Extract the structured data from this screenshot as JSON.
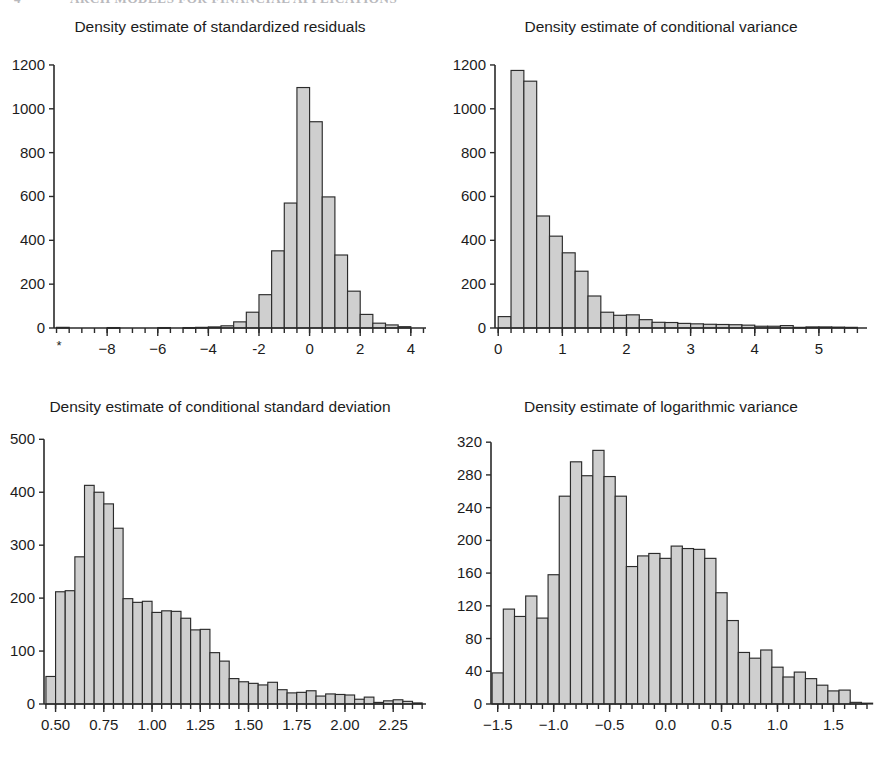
{
  "page": {
    "running_header": {
      "folio": "4",
      "title": "ARCH MODELS FOR FINANCIAL APPLICATIONS"
    },
    "background_color": "#ffffff",
    "bar_fill_color": "#cfcfcf",
    "bar_stroke_color": "#2b2b2b",
    "text_color": "#1c1c1c"
  },
  "chart_data": [
    {
      "id": "standardized-residuals",
      "type": "bar",
      "title": "Density estimate of standardized residuals",
      "xlabel": "",
      "ylabel": "",
      "grid": false,
      "legend": null,
      "xlim": [
        -10.1,
        4.6
      ],
      "ylim": [
        0,
        1250
      ],
      "xticks": [
        -8,
        -6,
        -4,
        -2,
        0,
        2,
        4
      ],
      "xtick_labels": [
        "−8",
        "−6",
        "−4",
        "-2",
        "0",
        "2",
        "4"
      ],
      "yticks": [
        0,
        200,
        400,
        600,
        800,
        1000,
        1200
      ],
      "ytick_labels": [
        "0",
        "200",
        "400",
        "600",
        "800",
        "1000",
        "1200"
      ],
      "minor_tick_step": 0.5,
      "extra_marks": [
        {
          "glyph": "*",
          "x": -9.9,
          "note": "outlier marker at left edge of axis"
        }
      ],
      "bin_width": 0.5,
      "bin_starts": [
        -10.0,
        -9.5,
        -9.0,
        -8.5,
        -8.0,
        -7.5,
        -7.0,
        -6.5,
        -6.0,
        -5.5,
        -5.0,
        -4.5,
        -4.0,
        -3.5,
        -3.0,
        -2.5,
        -2.0,
        -1.5,
        -1.0,
        -0.5,
        0.0,
        0.5,
        1.0,
        1.5,
        2.0,
        2.5,
        3.0,
        3.5
      ],
      "values": [
        3,
        0,
        0,
        0,
        2,
        0,
        0,
        0,
        2,
        0,
        2,
        3,
        5,
        10,
        28,
        72,
        152,
        352,
        570,
        1097,
        941,
        598,
        333,
        168,
        62,
        22,
        14,
        6
      ]
    },
    {
      "id": "conditional-variance",
      "type": "bar",
      "title": "Density estimate of conditional variance",
      "xlabel": "",
      "ylabel": "",
      "grid": false,
      "legend": null,
      "xlim": [
        -0.05,
        5.75
      ],
      "ylim": [
        0,
        1250
      ],
      "xticks": [
        0,
        1,
        2,
        3,
        4,
        5
      ],
      "xtick_labels": [
        "0",
        "1",
        "2",
        "3",
        "4",
        "5"
      ],
      "yticks": [
        0,
        200,
        400,
        600,
        800,
        1000,
        1200
      ],
      "ytick_labels": [
        "0",
        "200",
        "400",
        "600",
        "800",
        "1000",
        "1200"
      ],
      "minor_tick_step": 0.2,
      "extra_marks": [],
      "bin_width": 0.2,
      "bin_starts": [
        0.0,
        0.2,
        0.4,
        0.6,
        0.8,
        1.0,
        1.2,
        1.4,
        1.6,
        1.8,
        2.0,
        2.2,
        2.4,
        2.6,
        2.8,
        3.0,
        3.2,
        3.4,
        3.6,
        3.8,
        4.0,
        4.2,
        4.4,
        4.6,
        4.8,
        5.0,
        5.2,
        5.4
      ],
      "values": [
        52,
        1175,
        1126,
        511,
        419,
        343,
        259,
        146,
        72,
        58,
        60,
        38,
        26,
        25,
        21,
        19,
        17,
        16,
        15,
        13,
        8,
        8,
        11,
        3,
        5,
        5,
        4,
        3
      ]
    },
    {
      "id": "conditional-standard-deviation",
      "type": "bar",
      "title": "Density estimate of conditional standard deviation",
      "xlabel": "",
      "ylabel": "",
      "grid": false,
      "legend": null,
      "xlim": [
        0.44,
        2.42
      ],
      "ylim": [
        0,
        510
      ],
      "xticks": [
        0.5,
        0.75,
        1.0,
        1.25,
        1.5,
        1.75,
        2.0,
        2.25
      ],
      "xtick_labels": [
        "0.50",
        "0.75",
        "1.00",
        "1.25",
        "1.50",
        "1.75",
        "2.00",
        "2.25"
      ],
      "yticks": [
        0,
        100,
        200,
        300,
        400,
        500
      ],
      "ytick_labels": [
        "0",
        "100",
        "200",
        "300",
        "400",
        "500"
      ],
      "minor_tick_step": 0.05,
      "extra_marks": [],
      "bin_width": 0.05,
      "bin_starts": [
        0.45,
        0.5,
        0.55,
        0.6,
        0.65,
        0.7,
        0.75,
        0.8,
        0.85,
        0.9,
        0.95,
        1.0,
        1.05,
        1.1,
        1.15,
        1.2,
        1.25,
        1.3,
        1.35,
        1.4,
        1.45,
        1.5,
        1.55,
        1.6,
        1.65,
        1.7,
        1.75,
        1.8,
        1.85,
        1.9,
        1.95,
        2.0,
        2.05,
        2.1,
        2.15,
        2.2,
        2.25,
        2.3,
        2.35
      ],
      "values": [
        52,
        212,
        214,
        278,
        413,
        400,
        378,
        332,
        199,
        192,
        194,
        173,
        176,
        175,
        162,
        140,
        141,
        97,
        81,
        48,
        42,
        39,
        36,
        41,
        27,
        21,
        22,
        25,
        15,
        19,
        18,
        17,
        9,
        13,
        3,
        6,
        8,
        5,
        2
      ]
    },
    {
      "id": "logarithmic-variance",
      "type": "bar",
      "title": "Density estimate of logarithmic variance",
      "xlabel": "",
      "ylabel": "",
      "grid": false,
      "legend": null,
      "xlim": [
        -1.56,
        1.8
      ],
      "ylim": [
        0,
        330
      ],
      "xticks": [
        -1.5,
        -1.0,
        -0.5,
        0.0,
        0.5,
        1.0,
        1.5
      ],
      "xtick_labels": [
        "−1.5",
        "−1.0",
        "−0.5",
        "0.0",
        "0.5",
        "1.0",
        "1.5"
      ],
      "yticks": [
        0,
        40,
        80,
        120,
        160,
        200,
        240,
        280,
        320
      ],
      "ytick_labels": [
        "0",
        "40",
        "80",
        "120",
        "160",
        "200",
        "240",
        "280",
        "320"
      ],
      "minor_tick_step": 0.1,
      "extra_marks": [],
      "bin_width": 0.1,
      "bin_starts": [
        -1.55,
        -1.45,
        -1.35,
        -1.25,
        -1.15,
        -1.05,
        -0.95,
        -0.85,
        -0.75,
        -0.65,
        -0.55,
        -0.45,
        -0.35,
        -0.25,
        -0.15,
        -0.05,
        0.05,
        0.15,
        0.25,
        0.35,
        0.45,
        0.55,
        0.65,
        0.75,
        0.85,
        0.95,
        1.05,
        1.15,
        1.25,
        1.35,
        1.45,
        1.55,
        1.65,
        1.75
      ],
      "values": [
        38,
        116,
        107,
        132,
        105,
        158,
        254,
        296,
        279,
        310,
        278,
        254,
        168,
        181,
        184,
        178,
        193,
        190,
        189,
        178,
        136,
        102,
        63,
        56,
        66,
        45,
        33,
        39,
        31,
        23,
        16,
        17,
        2,
        1
      ]
    }
  ]
}
